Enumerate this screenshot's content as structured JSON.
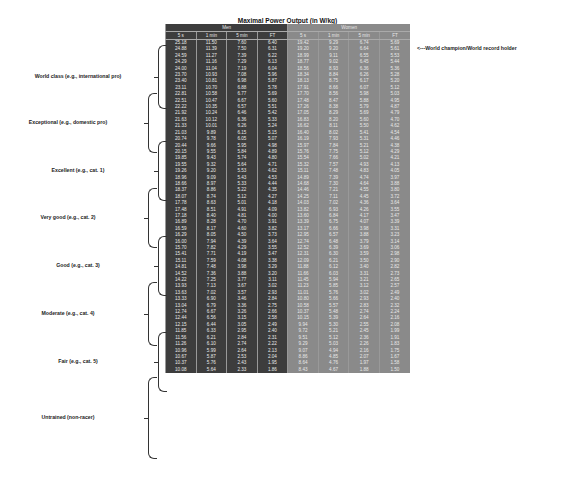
{
  "chart_data": {
    "type": "table",
    "title": "Maximal Power Output (in W/kg)",
    "groups": [
      "Men",
      "Women"
    ],
    "columns": [
      "5 s",
      "1 min",
      "5 min",
      "FT"
    ],
    "annotation": "<---World champion/World record holder",
    "categories": [
      {
        "label": "World class (e.g., international pro)",
        "top": 45,
        "height": 62
      },
      {
        "label": "Exceptional (e.g., domestic pro)",
        "top": 93,
        "height": 58
      },
      {
        "label": "Excellent (e.g., cat. 1)",
        "top": 141,
        "height": 58
      },
      {
        "label": "Very good (e.g., cat. 2)",
        "top": 188,
        "height": 58
      },
      {
        "label": "Good (e.g., cat. 3)",
        "top": 236,
        "height": 58
      },
      {
        "label": "Moderate (e.g., cat. 4)",
        "top": 282,
        "height": 62
      },
      {
        "label": "Fair (e.g., cat. 5)",
        "top": 332,
        "height": 58
      },
      {
        "label": "Untrained (non-racer)",
        "top": 377,
        "height": 80
      }
    ],
    "men_rows": [
      [
        "25.18",
        "11.50",
        "7.60",
        "6.40"
      ],
      [
        "24.88",
        "11.39",
        "7.50",
        "6.31"
      ],
      [
        "24.59",
        "11.27",
        "7.39",
        "6.22"
      ],
      [
        "24.29",
        "11.16",
        "7.29",
        "6.13"
      ],
      [
        "24.00",
        "11.04",
        "7.19",
        "6.04"
      ],
      [
        "23.70",
        "10.93",
        "7.08",
        "5.96"
      ],
      [
        "23.40",
        "10.81",
        "6.98",
        "5.87"
      ],
      [
        "23.11",
        "10.70",
        "6.88",
        "5.78"
      ],
      [
        "22.81",
        "10.58",
        "6.77",
        "5.69"
      ],
      [
        "22.51",
        "10.47",
        "6.67",
        "5.60"
      ],
      [
        "22.22",
        "10.35",
        "6.57",
        "5.51"
      ],
      [
        "21.92",
        "10.24",
        "6.46",
        "5.42"
      ],
      [
        "21.63",
        "10.12",
        "6.36",
        "5.33"
      ],
      [
        "21.33",
        "10.01",
        "6.26",
        "5.24"
      ],
      [
        "21.03",
        "9.89",
        "6.15",
        "5.15"
      ],
      [
        "20.74",
        "9.78",
        "6.05",
        "5.07"
      ],
      [
        "20.44",
        "9.66",
        "5.95",
        "4.98"
      ],
      [
        "20.15",
        "9.55",
        "5.84",
        "4.89"
      ],
      [
        "19.85",
        "9.43",
        "5.74",
        "4.80"
      ],
      [
        "19.55",
        "9.32",
        "5.64",
        "4.71"
      ],
      [
        "19.26",
        "9.20",
        "5.53",
        "4.62"
      ],
      [
        "18.96",
        "9.09",
        "5.43",
        "4.53"
      ],
      [
        "18.66",
        "8.97",
        "5.33",
        "4.44"
      ],
      [
        "18.37",
        "8.86",
        "5.22",
        "4.35"
      ],
      [
        "18.07",
        "8.74",
        "5.12",
        "4.27"
      ],
      [
        "17.78",
        "8.63",
        "5.01",
        "4.18"
      ],
      [
        "17.48",
        "8.51",
        "4.91",
        "4.09"
      ],
      [
        "17.18",
        "8.40",
        "4.81",
        "4.00"
      ],
      [
        "16.89",
        "8.28",
        "4.70",
        "3.91"
      ],
      [
        "16.59",
        "8.17",
        "4.60",
        "3.82"
      ],
      [
        "16.29",
        "8.05",
        "4.50",
        "3.73"
      ],
      [
        "16.00",
        "7.94",
        "4.39",
        "3.64"
      ],
      [
        "15.70",
        "7.82",
        "4.29",
        "3.55"
      ],
      [
        "15.41",
        "7.71",
        "4.19",
        "3.47"
      ],
      [
        "15.11",
        "7.59",
        "4.08",
        "3.38"
      ],
      [
        "14.81",
        "7.48",
        "3.98",
        "3.29"
      ],
      [
        "14.52",
        "7.36",
        "3.88",
        "3.20"
      ],
      [
        "14.22",
        "7.25",
        "3.77",
        "3.11"
      ],
      [
        "13.93",
        "7.13",
        "3.67",
        "3.02"
      ],
      [
        "13.63",
        "7.02",
        "3.57",
        "2.93"
      ],
      [
        "13.33",
        "6.90",
        "3.46",
        "2.84"
      ],
      [
        "13.04",
        "6.79",
        "3.36",
        "2.75"
      ],
      [
        "12.74",
        "6.67",
        "3.26",
        "2.66"
      ],
      [
        "12.44",
        "6.56",
        "3.15",
        "2.58"
      ],
      [
        "12.15",
        "6.44",
        "3.05",
        "2.49"
      ],
      [
        "11.85",
        "6.33",
        "2.95",
        "2.40"
      ],
      [
        "11.56",
        "6.21",
        "2.84",
        "2.31"
      ],
      [
        "11.26",
        "6.10",
        "2.74",
        "2.22"
      ],
      [
        "10.96",
        "5.99",
        "2.64",
        "2.13"
      ],
      [
        "10.67",
        "5.87",
        "2.53",
        "2.04"
      ],
      [
        "10.37",
        "5.76",
        "2.43",
        "1.95"
      ],
      [
        "10.08",
        "5.64",
        "2.33",
        "1.86"
      ]
    ],
    "women_rows": [
      [
        "19.42",
        "9.29",
        "6.74",
        "5.69"
      ],
      [
        "19.20",
        "9.20",
        "6.64",
        "5.61"
      ],
      [
        "18.99",
        "9.11",
        "6.55",
        "5.53"
      ],
      [
        "18.77",
        "9.02",
        "6.45",
        "5.44"
      ],
      [
        "18.56",
        "8.93",
        "6.36",
        "5.36"
      ],
      [
        "18.34",
        "8.84",
        "6.26",
        "5.28"
      ],
      [
        "18.13",
        "8.75",
        "6.17",
        "5.20"
      ],
      [
        "17.91",
        "8.66",
        "6.07",
        "5.12"
      ],
      [
        "17.70",
        "8.56",
        "5.98",
        "5.03"
      ],
      [
        "17.48",
        "8.47",
        "5.88",
        "4.95"
      ],
      [
        "17.26",
        "8.38",
        "5.79",
        "4.87"
      ],
      [
        "17.05",
        "8.29",
        "5.69",
        "4.79"
      ],
      [
        "16.83",
        "8.20",
        "5.60",
        "4.70"
      ],
      [
        "16.62",
        "8.11",
        "5.50",
        "4.62"
      ],
      [
        "16.40",
        "8.02",
        "5.41",
        "4.54"
      ],
      [
        "16.19",
        "7.93",
        "5.31",
        "4.46"
      ],
      [
        "15.97",
        "7.84",
        "5.21",
        "4.38"
      ],
      [
        "15.76",
        "7.75",
        "5.12",
        "4.29"
      ],
      [
        "15.54",
        "7.66",
        "5.02",
        "4.21"
      ],
      [
        "15.32",
        "7.57",
        "4.93",
        "4.13"
      ],
      [
        "15.11",
        "7.48",
        "4.83",
        "4.05"
      ],
      [
        "14.89",
        "7.39",
        "4.74",
        "3.97"
      ],
      [
        "14.68",
        "7.30",
        "4.64",
        "3.88"
      ],
      [
        "14.46",
        "7.21",
        "4.55",
        "3.80"
      ],
      [
        "14.25",
        "7.11",
        "4.45",
        "3.72"
      ],
      [
        "14.03",
        "7.02",
        "4.36",
        "3.64"
      ],
      [
        "13.82",
        "6.93",
        "4.26",
        "3.55"
      ],
      [
        "13.60",
        "6.84",
        "4.17",
        "3.47"
      ],
      [
        "13.39",
        "6.75",
        "4.07",
        "3.39"
      ],
      [
        "13.17",
        "6.66",
        "3.98",
        "3.31"
      ],
      [
        "12.95",
        "6.57",
        "3.88",
        "3.23"
      ],
      [
        "12.74",
        "6.48",
        "3.79",
        "3.14"
      ],
      [
        "12.52",
        "6.39",
        "3.69",
        "3.06"
      ],
      [
        "12.31",
        "6.30",
        "3.59",
        "2.98"
      ],
      [
        "12.09",
        "6.21",
        "3.50",
        "2.90"
      ],
      [
        "11.88",
        "6.12",
        "3.40",
        "2.82"
      ],
      [
        "11.66",
        "6.03",
        "3.31",
        "2.73"
      ],
      [
        "11.45",
        "5.94",
        "3.21",
        "2.65"
      ],
      [
        "11.23",
        "5.85",
        "3.12",
        "2.57"
      ],
      [
        "11.01",
        "5.76",
        "3.02",
        "2.49"
      ],
      [
        "10.80",
        "5.66",
        "2.93",
        "2.40"
      ],
      [
        "10.58",
        "5.57",
        "2.83",
        "2.32"
      ],
      [
        "10.37",
        "5.48",
        "2.74",
        "2.24"
      ],
      [
        "10.15",
        "5.39",
        "2.64",
        "2.16"
      ],
      [
        "9.94",
        "5.30",
        "2.55",
        "2.08"
      ],
      [
        "9.72",
        "5.21",
        "2.45",
        "1.99"
      ],
      [
        "9.51",
        "5.12",
        "2.36",
        "1.91"
      ],
      [
        "9.29",
        "5.03",
        "2.26",
        "1.83"
      ],
      [
        "9.07",
        "4.94",
        "2.16",
        "1.75"
      ],
      [
        "8.86",
        "4.85",
        "2.07",
        "1.67"
      ],
      [
        "8.64",
        "4.76",
        "1.97",
        "1.58"
      ],
      [
        "8.43",
        "4.67",
        "1.88",
        "1.50"
      ]
    ]
  }
}
